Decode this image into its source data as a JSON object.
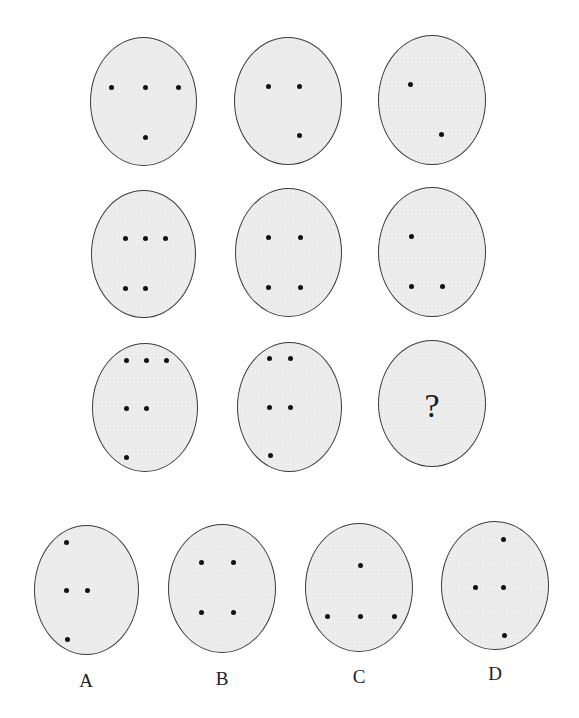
{
  "puzzle": {
    "grid": [
      {
        "id": "r1c1",
        "box": [
          90,
          37,
          107,
          129
        ],
        "dots": [
          [
            111,
            87
          ],
          [
            145,
            87
          ],
          [
            178,
            87
          ],
          [
            145,
            137
          ]
        ]
      },
      {
        "id": "r1c2",
        "box": [
          234,
          37,
          108,
          128
        ],
        "dots": [
          [
            268,
            86
          ],
          [
            299,
            86
          ],
          [
            299,
            135
          ]
        ]
      },
      {
        "id": "r1c3",
        "box": [
          378,
          35,
          108,
          130
        ],
        "dots": [
          [
            410,
            84
          ],
          [
            441,
            134
          ]
        ]
      },
      {
        "id": "r2c1",
        "box": [
          91,
          190,
          105,
          128
        ],
        "dots": [
          [
            125,
            238
          ],
          [
            145,
            238
          ],
          [
            165,
            238
          ],
          [
            125,
            288
          ],
          [
            145,
            288
          ]
        ]
      },
      {
        "id": "r2c2",
        "box": [
          235,
          188,
          107,
          129
        ],
        "dots": [
          [
            268,
            237
          ],
          [
            300,
            237
          ],
          [
            268,
            287
          ],
          [
            300,
            287
          ]
        ]
      },
      {
        "id": "r2c3",
        "box": [
          378,
          187,
          108,
          130
        ],
        "dots": [
          [
            411,
            236
          ],
          [
            411,
            286
          ],
          [
            442,
            286
          ]
        ]
      },
      {
        "id": "r3c1",
        "box": [
          92,
          343,
          106,
          129
        ],
        "dots": [
          [
            126,
            360
          ],
          [
            146,
            360
          ],
          [
            166,
            360
          ],
          [
            126,
            408
          ],
          [
            146,
            408
          ],
          [
            126,
            457
          ]
        ]
      },
      {
        "id": "r3c2",
        "box": [
          237,
          342,
          105,
          130
        ],
        "dots": [
          [
            269,
            358
          ],
          [
            290,
            358
          ],
          [
            269,
            407
          ],
          [
            290,
            407
          ],
          [
            270,
            455
          ]
        ]
      },
      {
        "id": "r3c3",
        "box": [
          378,
          340,
          108,
          127
        ],
        "dots": [],
        "question": "?",
        "question_pos": [
          432,
          406
        ]
      }
    ],
    "options": [
      {
        "label": "A",
        "label_pos": [
          86,
          680
        ],
        "box": [
          34,
          525,
          105,
          130
        ],
        "dots": [
          [
            66,
            542
          ],
          [
            66,
            590
          ],
          [
            87,
            590
          ],
          [
            67,
            639
          ]
        ]
      },
      {
        "label": "B",
        "label_pos": [
          222,
          678
        ],
        "box": [
          168,
          524,
          108,
          129
        ],
        "dots": [
          [
            201,
            562
          ],
          [
            233,
            562
          ],
          [
            201,
            612
          ],
          [
            233,
            612
          ]
        ]
      },
      {
        "label": "C",
        "label_pos": [
          359,
          676
        ],
        "box": [
          305,
          523,
          108,
          129
        ],
        "dots": [
          [
            360,
            565
          ],
          [
            327,
            616
          ],
          [
            360,
            616
          ],
          [
            394,
            616
          ]
        ]
      },
      {
        "label": "D",
        "label_pos": [
          495,
          673
        ],
        "box": [
          441,
          521,
          108,
          129
        ],
        "dots": [
          [
            503,
            539
          ],
          [
            475,
            587
          ],
          [
            503,
            587
          ],
          [
            504,
            635
          ]
        ]
      }
    ]
  },
  "colors": {
    "background": "#ffffff",
    "oval_fill": "#ececec",
    "oval_border": "#3c3c3c",
    "dot": "#111111",
    "text": "#222222"
  }
}
